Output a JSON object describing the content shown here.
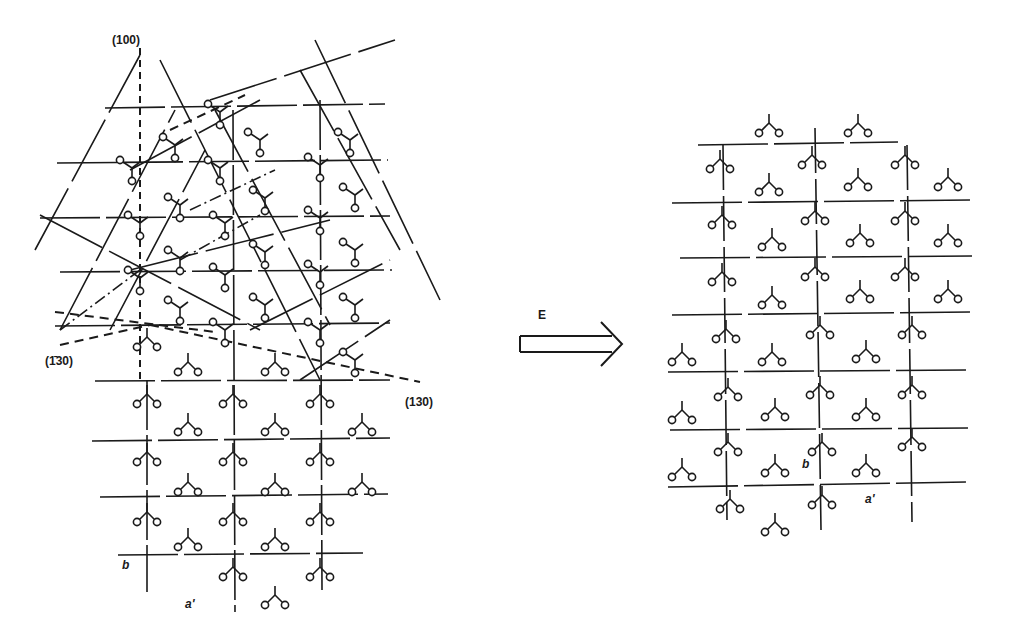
{
  "figure": {
    "ink_color": "#1a1a1a",
    "background": "#ffffff"
  },
  "left_panel": {
    "name": "initial-lattice",
    "labels": {
      "plane_100": "(100)",
      "plane_1bar30": "(1̄30)",
      "plane_130": "(130)",
      "axis_b": "b",
      "axis_a": "a'"
    },
    "label_positions": {
      "plane_100": [
        112,
        33
      ],
      "plane_1bar30": [
        45,
        354
      ],
      "plane_130": [
        405,
        395
      ],
      "axis_b": [
        122,
        558
      ],
      "axis_a": [
        185,
        597
      ]
    },
    "horizontal_lines": [
      [
        105,
        108,
        385,
        104
      ],
      [
        57,
        163,
        388,
        160
      ],
      [
        40,
        218,
        390,
        216
      ],
      [
        60,
        272,
        392,
        270
      ],
      [
        55,
        326,
        390,
        323
      ],
      [
        95,
        381,
        390,
        380
      ],
      [
        92,
        441,
        390,
        438
      ],
      [
        100,
        497,
        388,
        494
      ],
      [
        118,
        555,
        363,
        553
      ]
    ],
    "vertical_lines": [
      [
        147,
        380,
        147,
        592
      ],
      [
        233,
        110,
        235,
        612
      ],
      [
        320,
        100,
        322,
        590
      ],
      [
        140,
        30,
        140,
        375
      ]
    ],
    "dashed_vertical": [
      [
        140,
        48,
        140,
        380
      ]
    ],
    "oblique_lines": [
      [
        35,
        250,
        140,
        55
      ],
      [
        60,
        330,
        175,
        110
      ],
      [
        110,
        330,
        205,
        150
      ],
      [
        160,
        60,
        320,
        380
      ],
      [
        215,
        110,
        330,
        325
      ],
      [
        300,
        70,
        400,
        250
      ],
      [
        210,
        100,
        395,
        40
      ],
      [
        130,
        170,
        260,
        100
      ],
      [
        40,
        215,
        260,
        330
      ],
      [
        130,
        270,
        330,
        220
      ],
      [
        250,
        330,
        390,
        260
      ],
      [
        300,
        380,
        390,
        320
      ],
      [
        315,
        40,
        440,
        300
      ]
    ],
    "dashed_lines": [
      [
        60,
        345,
        150,
        325
      ],
      [
        150,
        325,
        420,
        382
      ],
      [
        55,
        312,
        215,
        332
      ],
      [
        170,
        130,
        245,
        95
      ]
    ],
    "dashdot_lines": [
      [
        180,
        260,
        260,
        215
      ],
      [
        190,
        210,
        275,
        170
      ],
      [
        60,
        330,
        140,
        270
      ]
    ],
    "molecules_vertex_up": [
      [
        147,
        397
      ],
      [
        233,
        397
      ],
      [
        320,
        397
      ],
      [
        147,
        455
      ],
      [
        233,
        455
      ],
      [
        320,
        455
      ],
      [
        147,
        515
      ],
      [
        233,
        515
      ],
      [
        320,
        515
      ],
      [
        233,
        570
      ],
      [
        320,
        570
      ],
      [
        147,
        340
      ]
    ],
    "molecules_inverted": [
      [
        188,
        365
      ],
      [
        275,
        365
      ],
      [
        188,
        425
      ],
      [
        275,
        425
      ],
      [
        362,
        425
      ],
      [
        188,
        485
      ],
      [
        275,
        485
      ],
      [
        362,
        485
      ],
      [
        188,
        540
      ],
      [
        275,
        540
      ],
      [
        275,
        598
      ]
    ],
    "molecules_rotated": [
      [
        132,
        168
      ],
      [
        220,
        112
      ],
      [
        175,
        145
      ],
      [
        260,
        140
      ],
      [
        350,
        140
      ],
      [
        140,
        223
      ],
      [
        180,
        205
      ],
      [
        225,
        223
      ],
      [
        265,
        198
      ],
      [
        320,
        165
      ],
      [
        355,
        195
      ],
      [
        140,
        278
      ],
      [
        180,
        258
      ],
      [
        225,
        275
      ],
      [
        265,
        252
      ],
      [
        320,
        218
      ],
      [
        355,
        250
      ],
      [
        180,
        308
      ],
      [
        225,
        330
      ],
      [
        265,
        305
      ],
      [
        320,
        272
      ],
      [
        355,
        305
      ],
      [
        320,
        330
      ],
      [
        355,
        360
      ],
      [
        220,
        168
      ]
    ]
  },
  "arrow": {
    "label": "E",
    "label_position": [
      538,
      313
    ],
    "shaft": [
      520,
      336,
      620,
      352
    ],
    "head_tip": [
      620,
      344
    ]
  },
  "right_panel": {
    "name": "field-aligned-lattice",
    "labels": {
      "axis_b": "b",
      "axis_a": "a'"
    },
    "label_positions": {
      "axis_b": [
        802,
        463
      ],
      "axis_a": [
        865,
        498
      ]
    },
    "horizontal_lines": [
      [
        698,
        145,
        898,
        142
      ],
      [
        672,
        203,
        972,
        200
      ],
      [
        680,
        258,
        972,
        256
      ],
      [
        672,
        315,
        970,
        312
      ],
      [
        668,
        372,
        968,
        370
      ],
      [
        670,
        430,
        970,
        428
      ],
      [
        668,
        487,
        970,
        482
      ]
    ],
    "vertical_lines": [
      [
        723,
        145,
        727,
        520
      ],
      [
        815,
        128,
        821,
        530
      ],
      [
        907,
        145,
        912,
        522
      ]
    ],
    "molecules_vertex_up": [
      [
        720,
        162
      ],
      [
        812,
        158
      ],
      [
        905,
        158
      ],
      [
        722,
        218
      ],
      [
        815,
        214
      ],
      [
        905,
        214
      ],
      [
        722,
        275
      ],
      [
        815,
        270
      ],
      [
        905,
        270
      ],
      [
        726,
        332
      ],
      [
        820,
        328
      ],
      [
        912,
        328
      ],
      [
        728,
        390
      ],
      [
        820,
        388
      ],
      [
        912,
        388
      ],
      [
        728,
        445
      ],
      [
        822,
        445
      ],
      [
        912,
        440
      ],
      [
        730,
        502
      ],
      [
        822,
        498
      ]
    ],
    "molecules_inverted": [
      [
        769,
        126
      ],
      [
        858,
        126
      ],
      [
        769,
        185
      ],
      [
        858,
        180
      ],
      [
        948,
        180
      ],
      [
        772,
        240
      ],
      [
        860,
        236
      ],
      [
        948,
        236
      ],
      [
        772,
        298
      ],
      [
        860,
        292
      ],
      [
        948,
        292
      ],
      [
        682,
        355
      ],
      [
        772,
        355
      ],
      [
        866,
        352
      ],
      [
        682,
        413
      ],
      [
        775,
        410
      ],
      [
        866,
        410
      ],
      [
        682,
        470
      ],
      [
        775,
        466
      ],
      [
        866,
        466
      ],
      [
        775,
        525
      ]
    ]
  }
}
